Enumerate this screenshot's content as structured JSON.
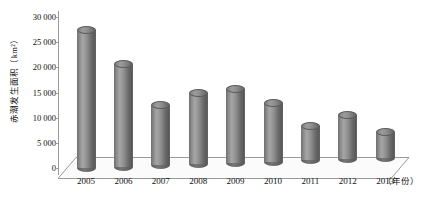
{
  "chart_data": {
    "type": "bar",
    "title": "",
    "subtitle": "",
    "xlabel": "（年份）",
    "ylabel": "赤潮发生面积（km²）",
    "categories": [
      "2005",
      "2006",
      "2007",
      "2008",
      "2009",
      "2010",
      "2011",
      "2012",
      "2013"
    ],
    "values": [
      27500,
      20500,
      12000,
      14200,
      14600,
      11600,
      6800,
      8800,
      5000
    ],
    "series": [
      {
        "name": "赤潮发生面积",
        "values": [
          27500,
          20500,
          12000,
          14200,
          14600,
          11600,
          6800,
          8800,
          5000
        ]
      }
    ],
    "ylim": [
      0,
      30000
    ],
    "y_tick_values": [
      0,
      5000,
      10000,
      15000,
      20000,
      25000,
      30000
    ],
    "y_tick_labels": [
      "0",
      "5 000",
      "10 000",
      "15 000",
      "20 000",
      "25 000",
      "30 000"
    ],
    "grid": false,
    "legend": false,
    "legend_position": "none",
    "bar_style": "3d-cylinder",
    "colors": {
      "bar_light": "#a6a6a6",
      "bar_mid": "#808080",
      "bar_dark": "#5a5a5a",
      "axis": "#9a9a9a",
      "floor": "#f2f2f2",
      "text": "#111111",
      "background": "#ffffff"
    },
    "annotations": []
  }
}
